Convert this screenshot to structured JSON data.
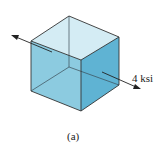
{
  "figure": {
    "stress_label": "4 ksi",
    "caption": "(a)",
    "colors": {
      "top_face": "#d4ecf4",
      "front_face": "#8ccbe0",
      "right_face": "#5fb3d3",
      "edge": "#333333"
    }
  }
}
